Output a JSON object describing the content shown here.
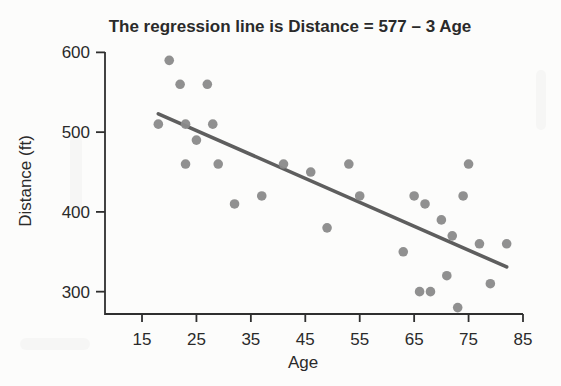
{
  "chart_data": {
    "type": "scatter",
    "title": "The regression line is Distance = 577 – 3 Age",
    "xlabel": "Age",
    "ylabel": "Distance (ft)",
    "x_ticks": [
      15,
      25,
      35,
      45,
      55,
      65,
      75,
      85
    ],
    "y_ticks": [
      300,
      400,
      500,
      600
    ],
    "xlim": [
      8.2,
      85
    ],
    "ylim": [
      272,
      608
    ],
    "grid": false,
    "legend": "none",
    "points": [
      {
        "age": 18,
        "distance": 510
      },
      {
        "age": 20,
        "distance": 590
      },
      {
        "age": 22,
        "distance": 560
      },
      {
        "age": 23,
        "distance": 510
      },
      {
        "age": 23,
        "distance": 460
      },
      {
        "age": 25,
        "distance": 490
      },
      {
        "age": 27,
        "distance": 560
      },
      {
        "age": 28,
        "distance": 510
      },
      {
        "age": 29,
        "distance": 460
      },
      {
        "age": 32,
        "distance": 410
      },
      {
        "age": 37,
        "distance": 420
      },
      {
        "age": 41,
        "distance": 460
      },
      {
        "age": 46,
        "distance": 450
      },
      {
        "age": 49,
        "distance": 380
      },
      {
        "age": 53,
        "distance": 460
      },
      {
        "age": 55,
        "distance": 420
      },
      {
        "age": 63,
        "distance": 350
      },
      {
        "age": 65,
        "distance": 420
      },
      {
        "age": 66,
        "distance": 300
      },
      {
        "age": 67,
        "distance": 410
      },
      {
        "age": 68,
        "distance": 300
      },
      {
        "age": 70,
        "distance": 390
      },
      {
        "age": 71,
        "distance": 320
      },
      {
        "age": 72,
        "distance": 370
      },
      {
        "age": 73,
        "distance": 280
      },
      {
        "age": 74,
        "distance": 420
      },
      {
        "age": 75,
        "distance": 460
      },
      {
        "age": 77,
        "distance": 360
      },
      {
        "age": 79,
        "distance": 310
      },
      {
        "age": 82,
        "distance": 360
      }
    ],
    "regression_line": {
      "equation": "Distance = 577 - 3 Age",
      "intercept": 577,
      "slope": -3,
      "age_start": 18,
      "age_end": 82
    },
    "colors": {
      "point": "#8a8a8a",
      "regression_line": "#5e5e5e",
      "axis": "#2f2f2f",
      "text": "#2a2a2a",
      "background": "#fcfcfb"
    }
  }
}
